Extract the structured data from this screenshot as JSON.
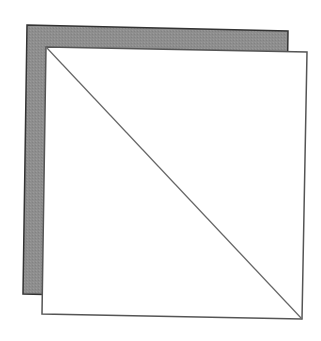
{
  "diagram": {
    "canvas": {
      "width": 321,
      "height": 341,
      "background": "#ffffff"
    },
    "back_square": {
      "points": [
        [
          27,
          25
        ],
        [
          288,
          31
        ],
        [
          284,
          300
        ],
        [
          23,
          294
        ]
      ],
      "fill": "#8e8e8e",
      "stroke": "#333333"
    },
    "front_square": {
      "points": [
        [
          46,
          47
        ],
        [
          307,
          52
        ],
        [
          302,
          319
        ],
        [
          42,
          314
        ]
      ],
      "fill": "#ffffff",
      "stroke": "#555555"
    },
    "diagonal": {
      "from": [
        46,
        47
      ],
      "to": [
        302,
        319
      ],
      "stroke": "#666666"
    }
  }
}
